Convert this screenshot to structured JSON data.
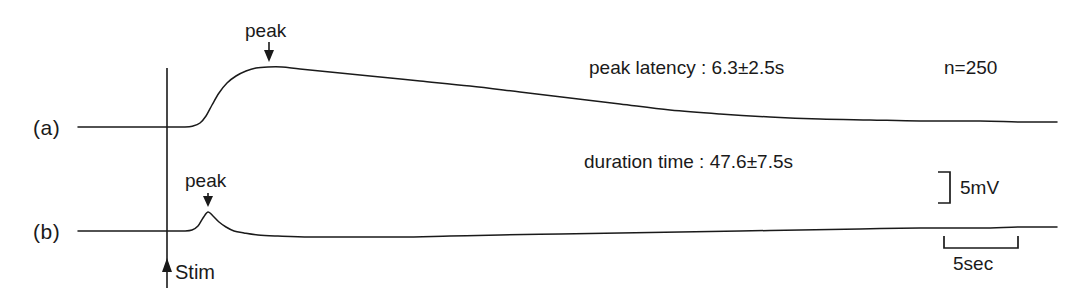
{
  "figure": {
    "type": "electrophysiology-trace-figure",
    "background_color": "#ffffff",
    "stroke_color": "#1a1a1a",
    "width": 1091,
    "height": 297
  },
  "traces": [
    {
      "name": "(a)",
      "peak_label": "peak",
      "baseline_y": 127,
      "peak_y": 67,
      "description": "slow large-amplitude response with gradual decay"
    },
    {
      "name": "(b)",
      "peak_label": "peak",
      "baseline_y": 231,
      "peak_y": 212,
      "description": "fast small-amplitude response with shallow undershoot"
    }
  ],
  "stimulus": {
    "label": "Stim",
    "marker": "up-arrow"
  },
  "annotations": {
    "peak_latency": "peak latency : 6.3±2.5s",
    "duration_time": "duration time : 47.6±7.5s",
    "sample_count": "n=250"
  },
  "scale_bars": {
    "vertical": {
      "label": "5mV",
      "value": 5,
      "unit": "mV"
    },
    "horizontal": {
      "label": "5sec",
      "value": 5,
      "unit": "sec"
    }
  },
  "chart_data": {
    "type": "line",
    "title": "",
    "xlabel": "",
    "ylabel": "",
    "grid": false,
    "legend": "none",
    "axis_style": "scale-bars-only",
    "stimulus_x": 167,
    "series": [
      {
        "name": "(a)",
        "baseline_y": 127,
        "points": [
          [
            78,
            127
          ],
          [
            120,
            127
          ],
          [
            160,
            127
          ],
          [
            185,
            127
          ],
          [
            193,
            126
          ],
          [
            200,
            123
          ],
          [
            206,
            116
          ],
          [
            212,
            105
          ],
          [
            219,
            93
          ],
          [
            227,
            83
          ],
          [
            236,
            76
          ],
          [
            246,
            71
          ],
          [
            256,
            68
          ],
          [
            268,
            67
          ],
          [
            282,
            67
          ],
          [
            300,
            69
          ],
          [
            330,
            72
          ],
          [
            370,
            76
          ],
          [
            420,
            81
          ],
          [
            470,
            86
          ],
          [
            520,
            92
          ],
          [
            570,
            98
          ],
          [
            620,
            104
          ],
          [
            670,
            110
          ],
          [
            720,
            114
          ],
          [
            770,
            117
          ],
          [
            820,
            119
          ],
          [
            870,
            120
          ],
          [
            920,
            121
          ],
          [
            980,
            121
          ],
          [
            1020,
            122
          ],
          [
            1057,
            122
          ]
        ]
      },
      {
        "name": "(b)",
        "baseline_y": 231,
        "points": [
          [
            78,
            231
          ],
          [
            130,
            231
          ],
          [
            170,
            231
          ],
          [
            184,
            231
          ],
          [
            192,
            230
          ],
          [
            198,
            226
          ],
          [
            203,
            218
          ],
          [
            208,
            212
          ],
          [
            213,
            216
          ],
          [
            219,
            222
          ],
          [
            226,
            227
          ],
          [
            234,
            231
          ],
          [
            244,
            233
          ],
          [
            258,
            235
          ],
          [
            278,
            236
          ],
          [
            310,
            237
          ],
          [
            350,
            237
          ],
          [
            400,
            237
          ],
          [
            450,
            236
          ],
          [
            500,
            235
          ],
          [
            560,
            234
          ],
          [
            620,
            233
          ],
          [
            680,
            232
          ],
          [
            740,
            231
          ],
          [
            800,
            230
          ],
          [
            860,
            229
          ],
          [
            920,
            228
          ],
          [
            980,
            228
          ],
          [
            1020,
            227
          ],
          [
            1057,
            227
          ]
        ]
      }
    ]
  }
}
